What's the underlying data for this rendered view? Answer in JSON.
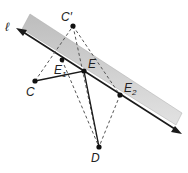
{
  "diagram": {
    "line_label": "ℓ",
    "points": {
      "C_prime": {
        "label": "C′",
        "x": 73,
        "y": 26
      },
      "C": {
        "label": "C",
        "x": 35,
        "y": 81
      },
      "E1": {
        "label": "E",
        "sub": "1",
        "x": 62,
        "y": 60
      },
      "E": {
        "label": "E",
        "x": 84,
        "y": 71
      },
      "E2": {
        "label": "E",
        "sub": "2",
        "x": 120,
        "y": 95
      },
      "D": {
        "label": "D",
        "x": 99,
        "y": 147
      }
    },
    "colors": {
      "band": "#cfcfcf",
      "line": "#1a1a1a",
      "dashed": "#555555"
    }
  }
}
